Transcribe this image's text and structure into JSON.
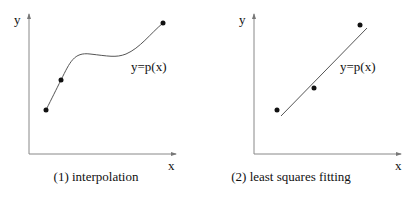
{
  "panels": [
    {
      "caption": "(1) interpolation",
      "y_axis_label": "y",
      "x_axis_label": "x",
      "curve_label": "y=p(x)",
      "points": [
        [
          46,
          110
        ],
        [
          61,
          80
        ],
        [
          163,
          23
        ]
      ]
    },
    {
      "caption": "(2) least squares fitting",
      "y_axis_label": "y",
      "x_axis_label": "x",
      "curve_label": "y=p(x)",
      "points": [
        [
          277,
          110
        ],
        [
          314,
          88
        ],
        [
          360,
          25
        ]
      ]
    }
  ],
  "colors": {
    "ink": "#111111",
    "axis": "#777777",
    "curve": "#555555"
  }
}
